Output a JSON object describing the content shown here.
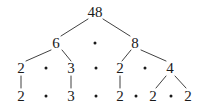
{
  "figure": {
    "type": "factor-tree",
    "background_color": "#ffffff",
    "text_color": "#1a1a1a",
    "line_color": "#2b2b2b",
    "width": 206,
    "height": 110
  },
  "rows": [
    {
      "name": "row-root",
      "nodes": [
        {
          "label": "48",
          "x": 95,
          "y": 12
        }
      ],
      "dots": []
    },
    {
      "name": "row-two",
      "nodes": [
        {
          "label": "6",
          "x": 56,
          "y": 43
        },
        {
          "label": "8",
          "x": 135,
          "y": 43
        }
      ],
      "dots": [
        {
          "x": 95,
          "y": 43
        }
      ]
    },
    {
      "name": "row-three",
      "nodes": [
        {
          "label": "2",
          "x": 21,
          "y": 68
        },
        {
          "label": "3",
          "x": 71,
          "y": 68
        },
        {
          "label": "2",
          "x": 120,
          "y": 68
        },
        {
          "label": "4",
          "x": 170,
          "y": 68
        }
      ],
      "dots": [
        {
          "x": 46,
          "y": 68
        },
        {
          "x": 96,
          "y": 68
        },
        {
          "x": 145,
          "y": 68
        }
      ]
    },
    {
      "name": "row-four",
      "nodes": [
        {
          "label": "2",
          "x": 21,
          "y": 96
        },
        {
          "label": "3",
          "x": 71,
          "y": 96
        },
        {
          "label": "2",
          "x": 120,
          "y": 96
        },
        {
          "label": "2",
          "x": 153,
          "y": 96
        },
        {
          "label": "2",
          "x": 188,
          "y": 96
        }
      ],
      "dots": [
        {
          "x": 46,
          "y": 96
        },
        {
          "x": 96,
          "y": 96
        },
        {
          "x": 136,
          "y": 96
        },
        {
          "x": 171,
          "y": 96
        }
      ]
    }
  ],
  "edges": [
    {
      "name": "edge-48-to-6",
      "x1": 88,
      "y1": 19,
      "x2": 61,
      "y2": 36
    },
    {
      "name": "edge-48-to-8",
      "x1": 103,
      "y1": 19,
      "x2": 130,
      "y2": 36
    },
    {
      "name": "edge-6-to-2",
      "x1": 51,
      "y1": 50,
      "x2": 26,
      "y2": 61
    },
    {
      "name": "edge-6-to-3",
      "x1": 62,
      "y1": 50,
      "x2": 71,
      "y2": 61
    },
    {
      "name": "edge-8-to-2",
      "x1": 131,
      "y1": 50,
      "x2": 122,
      "y2": 61
    },
    {
      "name": "edge-8-to-4",
      "x1": 141,
      "y1": 50,
      "x2": 166,
      "y2": 61
    },
    {
      "name": "edge-2-to-2-left",
      "x1": 21,
      "y1": 76,
      "x2": 21,
      "y2": 88
    },
    {
      "name": "edge-3-to-3",
      "x1": 71,
      "y1": 76,
      "x2": 71,
      "y2": 88
    },
    {
      "name": "edge-2-to-2-mid",
      "x1": 120,
      "y1": 76,
      "x2": 120,
      "y2": 88
    },
    {
      "name": "edge-4-to-2-left",
      "x1": 166,
      "y1": 76,
      "x2": 156,
      "y2": 88
    },
    {
      "name": "edge-4-to-2-right",
      "x1": 175,
      "y1": 76,
      "x2": 186,
      "y2": 88
    }
  ],
  "chart_data": {
    "type": "tree",
    "root": 48,
    "levels": [
      [
        48
      ],
      [
        6,
        8
      ],
      [
        2,
        3,
        2,
        4
      ],
      [
        2,
        3,
        2,
        2,
        2
      ]
    ],
    "prime_factors": [
      2,
      3,
      2,
      2,
      2
    ],
    "product_expression": "2 · 3 · 2 · 2 · 2"
  }
}
